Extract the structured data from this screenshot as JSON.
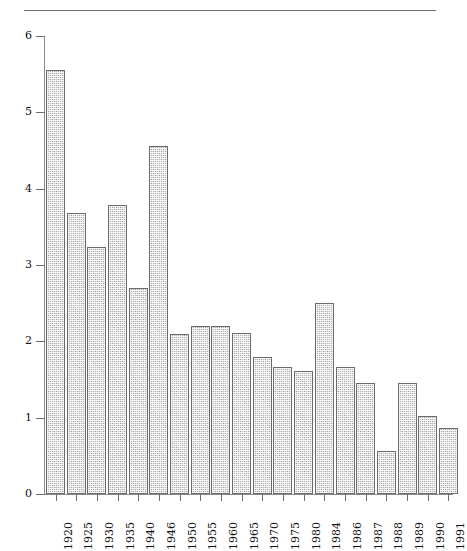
{
  "figure": {
    "top_caption": "",
    "background_color": "#ffffff",
    "bar_fill_color": "#b9b9b9",
    "bar_edge_color": "#6b6b6b",
    "axis_color": "#8a8a8a"
  },
  "chart_data": {
    "type": "bar",
    "title": "",
    "subtitle": "",
    "xlabel": "",
    "ylabel": "",
    "categories": [
      "1920",
      "1925",
      "1930",
      "1935",
      "1940",
      "1946",
      "1950",
      "1955",
      "1960",
      "1965",
      "1970",
      "1975",
      "1980",
      "1984",
      "1986",
      "1987",
      "1988",
      "1989",
      "1990",
      "1991"
    ],
    "values": [
      5.55,
      3.68,
      3.23,
      3.78,
      2.7,
      4.56,
      2.1,
      2.2,
      2.2,
      2.11,
      1.8,
      1.66,
      1.61,
      2.5,
      1.66,
      1.45,
      0.56,
      1.45,
      1.02,
      0.86
    ],
    "ylim": [
      0,
      6
    ],
    "yticks": [
      0,
      1,
      2,
      3,
      4,
      5,
      6
    ],
    "ytick_labels": [
      "0",
      "1",
      "2",
      "3",
      "4",
      "5",
      "6"
    ],
    "xtick_labels_rotation": 90,
    "grid": false,
    "legend": null,
    "series": [
      {
        "name": "",
        "values": [
          5.55,
          3.68,
          3.23,
          3.78,
          2.7,
          4.56,
          2.1,
          2.2,
          2.2,
          2.11,
          1.8,
          1.66,
          1.61,
          2.5,
          1.66,
          1.45,
          0.56,
          1.45,
          1.02,
          0.86
        ]
      }
    ]
  }
}
